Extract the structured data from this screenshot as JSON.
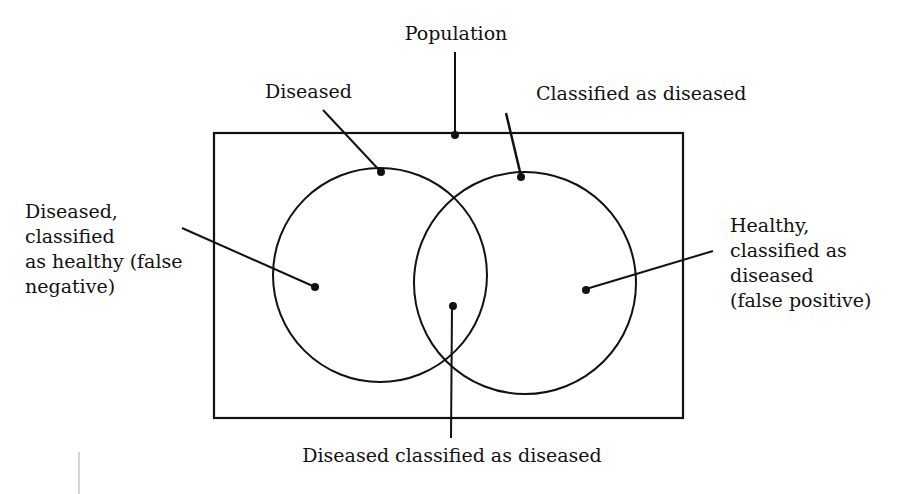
{
  "diagram": {
    "type": "venn",
    "container": {
      "label": "Population"
    },
    "sets": [
      {
        "id": "diseased",
        "label": "Diseased"
      },
      {
        "id": "classified",
        "label": "Classified as diseased"
      }
    ],
    "regions": {
      "false_negative": {
        "lines": [
          "Diseased,",
          "classified",
          "as healthy (false",
          "negative)"
        ]
      },
      "false_positive": {
        "lines": [
          "Healthy,",
          "classified as",
          "diseased",
          "(false positive)"
        ]
      },
      "true_positive": {
        "label": "Diseased classified as diseased"
      }
    },
    "colors": {
      "stroke": "#111111",
      "background": "#ffffff"
    }
  }
}
